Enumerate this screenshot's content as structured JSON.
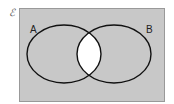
{
  "diagram": {
    "type": "venn",
    "universe_symbol": "ℰ",
    "sets": [
      {
        "label": "A"
      },
      {
        "label": "B"
      }
    ],
    "shading": "complement of A∩B shaded; A∩B unshaded",
    "colors": {
      "shaded": "#c8c8c8",
      "unshaded": "#ffffff",
      "outline": "#111111",
      "border": "#999999"
    }
  }
}
